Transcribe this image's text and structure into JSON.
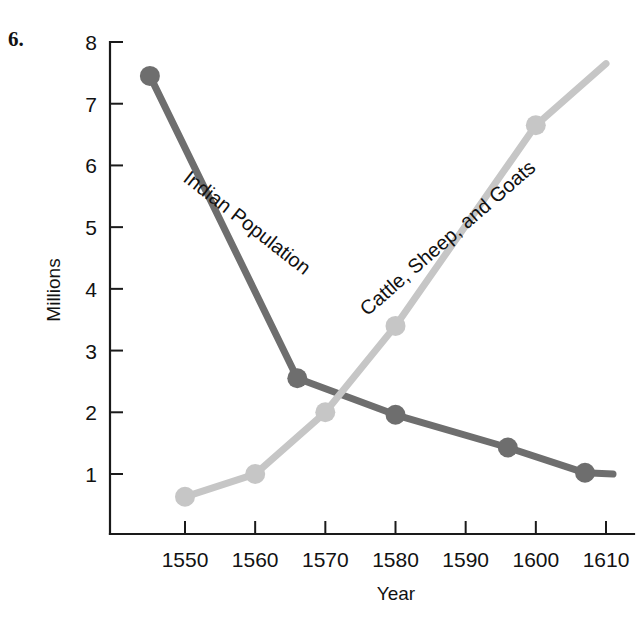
{
  "figure": {
    "number_label": "6.",
    "background_color": "#ffffff"
  },
  "chart_data": {
    "type": "line",
    "title": "",
    "xlabel": "Year",
    "ylabel": "Millions",
    "xlim": [
      1540,
      1612
    ],
    "ylim": [
      0,
      8
    ],
    "xticks": [
      1550,
      1560,
      1570,
      1580,
      1590,
      1600,
      1610
    ],
    "xtick_labels": [
      "1550",
      "1560",
      "1570",
      "1580",
      "1590",
      "1600",
      "1610"
    ],
    "yticks": [
      1,
      2,
      3,
      4,
      5,
      6,
      7,
      8
    ],
    "ytick_labels": [
      "1",
      "2",
      "3",
      "4",
      "5",
      "6",
      "7",
      "8"
    ],
    "grid": false,
    "legend_position": "inline-labels",
    "series": [
      {
        "name": "Indian Population",
        "color": "#6e6e6e",
        "label_rotation_deg": 38,
        "x": [
          1545,
          1566,
          1580,
          1596,
          1607,
          1611
        ],
        "values": [
          7.45,
          2.55,
          1.96,
          1.43,
          1.02,
          1.0
        ],
        "markers": [
          true,
          true,
          true,
          true,
          true,
          false
        ]
      },
      {
        "name": "Cattle, Sheep, and Goats",
        "color": "#c6c6c6",
        "label_rotation_deg": -41,
        "x": [
          1550,
          1560,
          1570,
          1580,
          1600,
          1610
        ],
        "values": [
          0.63,
          1.0,
          2.0,
          3.4,
          6.65,
          7.65
        ],
        "markers": [
          true,
          true,
          true,
          true,
          true,
          false
        ]
      }
    ]
  }
}
